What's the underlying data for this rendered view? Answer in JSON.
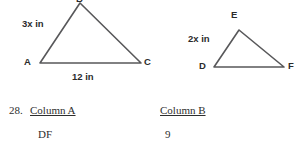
{
  "figures": {
    "triangle_abc": {
      "vertices": [
        {
          "name": "A",
          "label": "A",
          "label_x": 24,
          "label_y": 57,
          "px": 40,
          "py": 63
        },
        {
          "name": "B",
          "label": "B",
          "label_x": 76,
          "label_y": -6,
          "px": 80,
          "py": 3
        },
        {
          "name": "C",
          "label": "C",
          "label_x": 144,
          "label_y": 57,
          "px": 141,
          "py": 63
        }
      ],
      "side_labels": [
        {
          "text": "3x in",
          "x": 22,
          "y": 19,
          "side": "AB"
        },
        {
          "text": "12 in",
          "x": 72,
          "y": 72,
          "side": "AC"
        }
      ],
      "stroke_color": "#58585a",
      "stroke_width": 1.6
    },
    "triangle_def": {
      "vertices": [
        {
          "name": "D",
          "label": "D",
          "label_x": 199,
          "label_y": 61,
          "px": 214,
          "py": 67
        },
        {
          "name": "E",
          "label": "E",
          "label_x": 231,
          "label_y": 10,
          "px": 239,
          "py": 30
        },
        {
          "name": "F",
          "label": "F",
          "label_x": 288,
          "label_y": 61,
          "px": 284,
          "py": 67
        }
      ],
      "side_labels": [
        {
          "text": "2x in",
          "x": 188,
          "y": 34,
          "side": "DE"
        }
      ],
      "stroke_color": "#58585a",
      "stroke_width": 1.6
    }
  },
  "question": {
    "number": "28.",
    "column_a_heading": "Column A",
    "column_b_heading": "Column B",
    "column_a_value": "DF",
    "column_b_value": "9"
  }
}
